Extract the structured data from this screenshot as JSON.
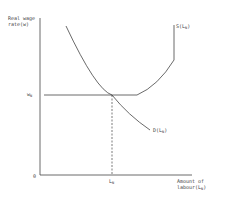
{
  "diagram": {
    "y_axis_label_line1": "Real wage",
    "y_axis_label_line2": "rate(w)",
    "x_axis_label_line1": "Amount of",
    "x_axis_label_line2": "labour(L",
    "x_axis_label_sub": "N",
    "x_axis_label_close": ")",
    "origin_label": "0",
    "wage_tick_label": "w",
    "wage_tick_sub": "N",
    "labour_tick_label": "L",
    "labour_tick_sub": "N",
    "supply_curve_label": "S(L",
    "supply_curve_sub": "N",
    "supply_curve_close": ")",
    "demand_curve_label": "D(L",
    "demand_curve_sub": "N",
    "demand_curve_close": ")",
    "line_color": "#444444"
  }
}
